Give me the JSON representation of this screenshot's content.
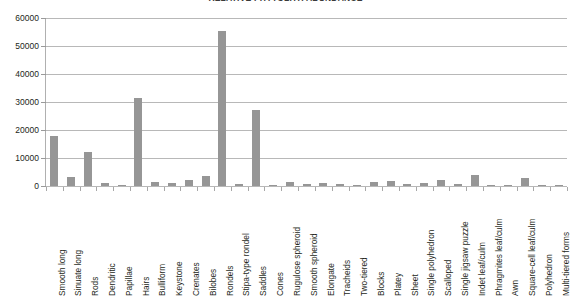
{
  "chart_data": {
    "type": "bar",
    "title": "RELATIVE PHYTOLITH ABUNDANCE",
    "xlabel": "",
    "ylabel": "",
    "ylim": [
      0,
      60000
    ],
    "ytick_step": 10000,
    "yticks": [
      "0",
      "10000",
      "20000",
      "30000",
      "40000",
      "50000",
      "60000"
    ],
    "grid": true,
    "legend": "none",
    "bar_color": "#969696",
    "gridline_color": "#b8b8b8",
    "axis_color": "#b0b0b0",
    "categories": [
      "Smooth long",
      "Sinuate long",
      "Rods",
      "Dendritic",
      "Papillae",
      "Hairs",
      "Bulliform",
      "Keystone",
      "Crenates",
      "Bilobes",
      "Rondels",
      "Stipa-type rondel",
      "Saddles",
      "Cones",
      "Rugulose spheroid",
      "Smooth spheroid",
      "Elongate",
      "Tracheids",
      "Two-tiered",
      "Blocks",
      "Platey",
      "Sheet",
      "Single polyhedron",
      "Scalloped",
      "Single jigsaw puzzle",
      "Indet leaf/culm",
      "Phragmites leaf/culm",
      "Awn",
      "Square-cell leaf/culm",
      "Polyhedron",
      "Multi-tiered forms"
    ],
    "values": [
      18000,
      3200,
      12000,
      1200,
      400,
      31500,
      1500,
      1200,
      2100,
      3600,
      55500,
      700,
      27000,
      500,
      1300,
      800,
      1200,
      600,
      300,
      1400,
      1800,
      700,
      1000,
      2300,
      600,
      3800,
      400,
      500,
      2800,
      300,
      200
    ]
  }
}
